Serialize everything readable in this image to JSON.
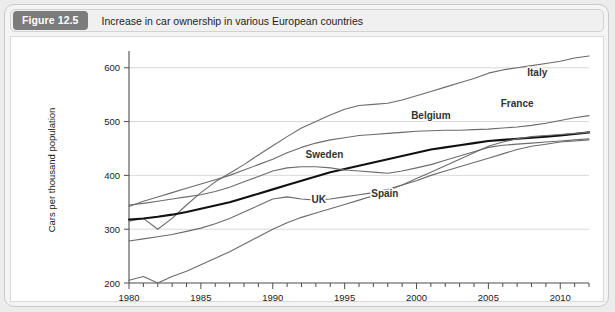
{
  "figure": {
    "badge": "Figure 12.5",
    "caption": "Increase in car ownership in various European countries"
  },
  "colors": {
    "page_background": "#ececec",
    "panel_background": "#ffffff",
    "badge_background": "#7b7b7b",
    "badge_text": "#ffffff",
    "grid": "#cfcfcf",
    "axis": "#4d4d4d",
    "series_default": "#6b6b6b",
    "series_highlight": "#111111"
  },
  "chart_data": {
    "type": "line",
    "title": "Increase in car ownership in various European countries",
    "xlabel": "",
    "ylabel": "Cars per thousand population",
    "xlim": [
      1980,
      2012
    ],
    "ylim": [
      200,
      620
    ],
    "yticks": [
      200,
      300,
      400,
      500,
      600
    ],
    "xticks": [
      1980,
      1985,
      1990,
      1995,
      2000,
      2005,
      2010
    ],
    "xtick_labels": [
      "1980",
      "1985",
      "1990",
      "1995",
      "2000",
      "2005",
      "2010"
    ],
    "ytick_labels": [
      "200",
      "300",
      "400",
      "500",
      "600"
    ],
    "minor_x_step": 1,
    "grid": "horizontal",
    "legend": "inline-labels",
    "x": [
      1980,
      1981,
      1982,
      1983,
      1984,
      1985,
      1986,
      1987,
      1988,
      1989,
      1990,
      1991,
      1992,
      1993,
      1994,
      1995,
      1996,
      1997,
      1998,
      1999,
      2000,
      2001,
      2002,
      2003,
      2004,
      2005,
      2006,
      2007,
      2008,
      2009,
      2010,
      2011,
      2012
    ],
    "series": [
      {
        "name": "Italy",
        "label": "Italy",
        "highlight": false,
        "label_x": 2008.4,
        "label_y": 585,
        "values": [
          315,
          320,
          300,
          320,
          345,
          368,
          388,
          404,
          420,
          438,
          455,
          472,
          488,
          500,
          512,
          523,
          530,
          532,
          534,
          540,
          548,
          556,
          564,
          572,
          580,
          590,
          596,
          600,
          604,
          608,
          612,
          618,
          622
        ]
      },
      {
        "name": "France",
        "label": "France",
        "highlight": false,
        "label_x": 2007.0,
        "label_y": 528,
        "values": [
          342,
          352,
          360,
          368,
          376,
          384,
          392,
          400,
          410,
          420,
          430,
          442,
          452,
          460,
          466,
          470,
          474,
          476,
          478,
          480,
          482,
          483,
          484,
          484,
          485,
          486,
          488,
          490,
          493,
          497,
          502,
          507,
          511
        ]
      },
      {
        "name": "Belgium",
        "label": "Belgium",
        "highlight": true,
        "label_x": 2001.0,
        "label_y": 505,
        "values": [
          318,
          320,
          323,
          327,
          332,
          338,
          344,
          350,
          358,
          366,
          374,
          382,
          390,
          398,
          406,
          412,
          418,
          424,
          430,
          436,
          442,
          448,
          452,
          456,
          460,
          464,
          466,
          468,
          470,
          472,
          474,
          477,
          480
        ]
      },
      {
        "name": "Sweden",
        "label": "Sweden",
        "highlight": false,
        "label_x": 1993.6,
        "label_y": 432,
        "values": [
          345,
          348,
          352,
          356,
          360,
          364,
          370,
          378,
          388,
          398,
          408,
          414,
          416,
          416,
          414,
          410,
          408,
          406,
          404,
          408,
          414,
          420,
          428,
          436,
          444,
          452,
          456,
          458,
          460,
          462,
          464,
          466,
          468
        ]
      },
      {
        "name": "UK",
        "label": "UK",
        "highlight": false,
        "label_x": 1993.2,
        "label_y": 348,
        "values": [
          278,
          282,
          286,
          290,
          296,
          302,
          310,
          320,
          332,
          344,
          356,
          360,
          356,
          354,
          356,
          360,
          364,
          368,
          374,
          382,
          390,
          400,
          408,
          416,
          424,
          432,
          440,
          448,
          454,
          458,
          462,
          464,
          466
        ]
      },
      {
        "name": "Spain",
        "label": "Spain",
        "highlight": false,
        "label_x": 1997.8,
        "label_y": 360,
        "values": [
          205,
          212,
          200,
          212,
          222,
          234,
          246,
          258,
          272,
          286,
          300,
          312,
          322,
          330,
          338,
          346,
          354,
          362,
          372,
          382,
          394,
          406,
          418,
          430,
          442,
          454,
          462,
          468,
          472,
          474,
          476,
          478,
          480
        ]
      }
    ]
  }
}
